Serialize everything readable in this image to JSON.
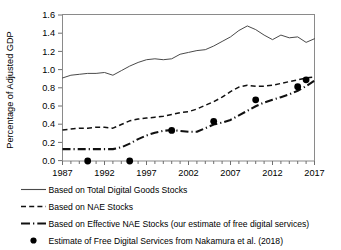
{
  "chart_data": {
    "type": "line",
    "title": "",
    "xlabel": "",
    "ylabel": "Percentage of Adjusted GDP",
    "xlim": [
      1987,
      2017
    ],
    "ylim": [
      0.0,
      1.6
    ],
    "ytick_step": 0.2,
    "xtick_step": 5,
    "grid": false,
    "legend_position": "below",
    "xticks": [
      "1987",
      "1992",
      "1997",
      "2002",
      "2007",
      "2012",
      "2017"
    ],
    "yticks": [
      "0.0",
      "0.2",
      "0.4",
      "0.6",
      "0.8",
      "1.0",
      "1.2",
      "1.4",
      "1.6"
    ],
    "x": [
      1987,
      1988,
      1989,
      1990,
      1991,
      1992,
      1993,
      1994,
      1995,
      1996,
      1997,
      1998,
      1999,
      2000,
      2001,
      2002,
      2003,
      2004,
      2005,
      2006,
      2007,
      2008,
      2009,
      2010,
      2011,
      2012,
      2013,
      2014,
      2015,
      2016,
      2017
    ],
    "series": [
      {
        "name": "Based on Total Digital Goods Stocks",
        "style": "solid",
        "values": [
          0.91,
          0.94,
          0.95,
          0.96,
          0.96,
          0.97,
          0.94,
          0.99,
          1.04,
          1.08,
          1.11,
          1.12,
          1.11,
          1.12,
          1.17,
          1.19,
          1.21,
          1.22,
          1.26,
          1.31,
          1.36,
          1.43,
          1.48,
          1.44,
          1.38,
          1.33,
          1.38,
          1.35,
          1.36,
          1.3,
          1.34
        ]
      },
      {
        "name": "Based on NAE Stocks",
        "style": "dashed",
        "values": [
          0.34,
          0.35,
          0.36,
          0.36,
          0.37,
          0.37,
          0.36,
          0.4,
          0.44,
          0.46,
          0.47,
          0.48,
          0.49,
          0.51,
          0.53,
          0.54,
          0.57,
          0.61,
          0.65,
          0.7,
          0.76,
          0.81,
          0.83,
          0.82,
          0.82,
          0.83,
          0.85,
          0.87,
          0.89,
          0.91,
          0.92
        ]
      },
      {
        "name": "Based on Effective NAE Stocks (our estimate of free digital services)",
        "style": "dashdot",
        "values": [
          0.13,
          0.13,
          0.13,
          0.13,
          0.13,
          0.13,
          0.13,
          0.15,
          0.19,
          0.24,
          0.28,
          0.31,
          0.33,
          0.34,
          0.33,
          0.32,
          0.32,
          0.36,
          0.4,
          0.42,
          0.45,
          0.5,
          0.55,
          0.6,
          0.64,
          0.67,
          0.7,
          0.73,
          0.77,
          0.82,
          0.88
        ]
      }
    ],
    "scatter": {
      "name": "Estimate of Free Digital Services from Nakamura et al. (2018)",
      "style": "dot",
      "points": [
        {
          "x": 1990,
          "y": 0.0
        },
        {
          "x": 1995,
          "y": 0.0
        },
        {
          "x": 2000,
          "y": 0.335
        },
        {
          "x": 2005,
          "y": 0.435
        },
        {
          "x": 2010,
          "y": 0.67
        },
        {
          "x": 2015,
          "y": 0.815
        },
        {
          "x": 2016,
          "y": 0.89
        }
      ]
    }
  },
  "legend": {
    "items": [
      {
        "label": "Based on Total Digital Goods Stocks",
        "style": "solid"
      },
      {
        "label": "Based on NAE Stocks",
        "style": "dashed"
      },
      {
        "label": "Based on Effective NAE Stocks (our estimate of free digital services)",
        "style": "dashdot"
      },
      {
        "label": "Estimate of Free Digital Services from Nakamura et al. (2018)",
        "style": "dot"
      }
    ]
  }
}
